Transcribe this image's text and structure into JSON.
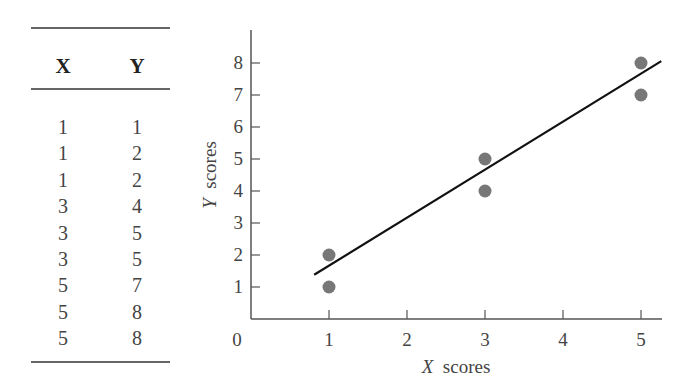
{
  "table": {
    "headers": [
      "X",
      "Y"
    ],
    "rows": [
      [
        "1",
        "1"
      ],
      [
        "1",
        "2"
      ],
      [
        "1",
        "2"
      ],
      [
        "3",
        "4"
      ],
      [
        "3",
        "5"
      ],
      [
        "3",
        "5"
      ],
      [
        "5",
        "7"
      ],
      [
        "5",
        "8"
      ],
      [
        "5",
        "8"
      ]
    ]
  },
  "chart_data": {
    "type": "scatter",
    "title": "",
    "xlabel": "X scores",
    "ylabel": "Y scores",
    "x_ticks": [
      "0",
      "1",
      "2",
      "3",
      "4",
      "5"
    ],
    "y_ticks": [
      "1",
      "2",
      "3",
      "4",
      "5",
      "6",
      "7",
      "8"
    ],
    "xlim": [
      0,
      5.3
    ],
    "ylim": [
      0,
      9
    ],
    "grid": false,
    "legend": null,
    "series": [
      {
        "name": "data points",
        "points": [
          [
            1,
            1
          ],
          [
            1,
            2
          ],
          [
            3,
            4
          ],
          [
            3,
            5
          ],
          [
            5,
            7
          ],
          [
            5,
            8
          ]
        ],
        "marker_color": "#777777"
      }
    ],
    "regression_line": {
      "slope": 1.5,
      "intercept": 0.167,
      "x_start": 0.81,
      "x_end": 5.26,
      "color": "#111111"
    }
  }
}
